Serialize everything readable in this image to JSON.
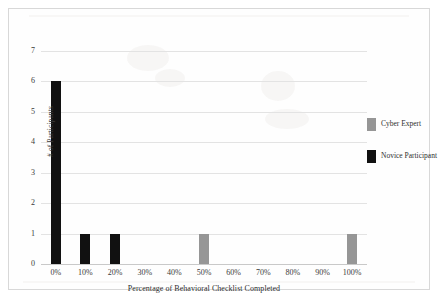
{
  "figure": {
    "background_color": "#fefefe",
    "border_color": "#d8d8d8"
  },
  "chart_data": {
    "type": "bar",
    "title": "",
    "xlabel": "Percentage of Behavioral Checklist Completed",
    "ylabel": "# of Participants",
    "categories": [
      "0%",
      "10%",
      "20%",
      "30%",
      "40%",
      "50%",
      "60%",
      "70%",
      "80%",
      "90%",
      "100%"
    ],
    "series": [
      {
        "name": "Cyber Expert",
        "color": "#969696",
        "values": [
          0,
          0,
          0,
          0,
          0,
          1,
          0,
          0,
          0,
          0,
          1
        ]
      },
      {
        "name": "Novice Participant",
        "color": "#111111",
        "values": [
          6,
          1,
          1,
          0,
          0,
          0,
          0,
          0,
          0,
          0,
          0
        ]
      }
    ],
    "ylim": [
      0,
      7
    ],
    "yticks": [
      0,
      1,
      2,
      3,
      4,
      5,
      6,
      7
    ],
    "ytick_labels": [
      "0",
      "1",
      "2",
      "3",
      "4",
      "5",
      "6",
      "7"
    ],
    "grid": "horizontal",
    "grid_color": "#e3e3e3",
    "legend_position": "right"
  },
  "legend": {
    "entries": [
      {
        "label": "Cyber Expert",
        "color": "#969696"
      },
      {
        "label": "Novice Participant",
        "color": "#111111"
      }
    ]
  }
}
